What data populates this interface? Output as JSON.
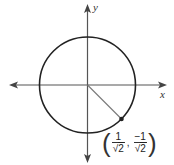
{
  "diagram": {
    "axes": {
      "x_label": "x",
      "y_label": "y"
    },
    "circle": {
      "center": [
        0,
        0
      ],
      "radius": 1
    },
    "point": {
      "x_num": "1",
      "x_den": "2",
      "y_num": "−1",
      "y_den": "2",
      "sqrt_symbol": "√",
      "comma": ","
    },
    "colors": {
      "axis": "#555555",
      "circle": "#222222",
      "radius_line": "#777777",
      "point": "#222222"
    }
  }
}
